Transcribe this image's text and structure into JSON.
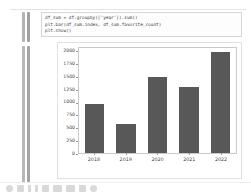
{
  "window": {
    "app": "jupyter-notebook",
    "background_color": "#ffffff"
  },
  "gutter": {
    "bars": [
      {
        "name": "code-cell-indicator-left"
      },
      {
        "name": "code-cell-indicator-right"
      },
      {
        "name": "output-cell-indicator-left"
      },
      {
        "name": "output-cell-indicator-right"
      }
    ]
  },
  "code_cell": {
    "lines": [
      "df_sum = df.groupby(['year']).sum()",
      "plt.bar(df_sum.index, df_sum.favorite_count)",
      "plt.show()"
    ]
  },
  "taskbar": {
    "icons": [
      "start-icon",
      "search-icon",
      "files-icon",
      "terminal-icon",
      "browser-icon",
      "editor-icon",
      "mail-icon",
      "music-icon",
      "settings-icon"
    ]
  },
  "chart_data": {
    "type": "bar",
    "title": "",
    "xlabel": "",
    "ylabel": "",
    "categories": [
      "2018",
      "2019",
      "2020",
      "2021",
      "2022"
    ],
    "values": [
      980,
      580,
      1500,
      1300,
      2000
    ],
    "series": [
      {
        "name": "favorite_count",
        "values": [
          980,
          580,
          1500,
          1300,
          2000
        ]
      }
    ],
    "ylim": [
      0,
      2080
    ],
    "yticks": [
      0,
      250,
      500,
      750,
      1000,
      1250,
      1500,
      1750,
      2000
    ],
    "ytick_labels": [
      "0",
      "250",
      "500",
      "750",
      "1000",
      "1250",
      "1500",
      "1750",
      "2000"
    ],
    "grid": false,
    "legend": false,
    "bar_color": "#585858",
    "axes_color": "#c9c9c9",
    "background_color": "#ffffff"
  }
}
